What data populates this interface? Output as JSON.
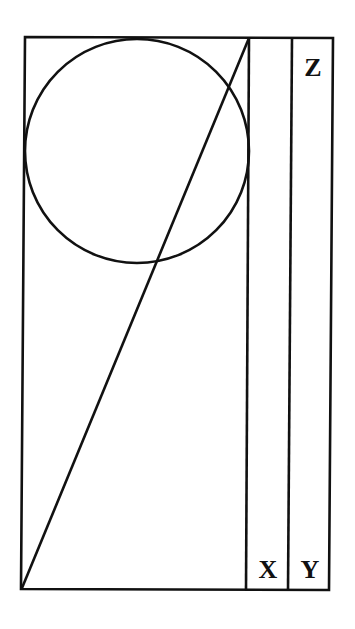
{
  "diagram": {
    "labels": {
      "z": "Z",
      "x": "X",
      "y": "Y"
    },
    "stroke_color": "#111111",
    "background": "#ffffff"
  }
}
